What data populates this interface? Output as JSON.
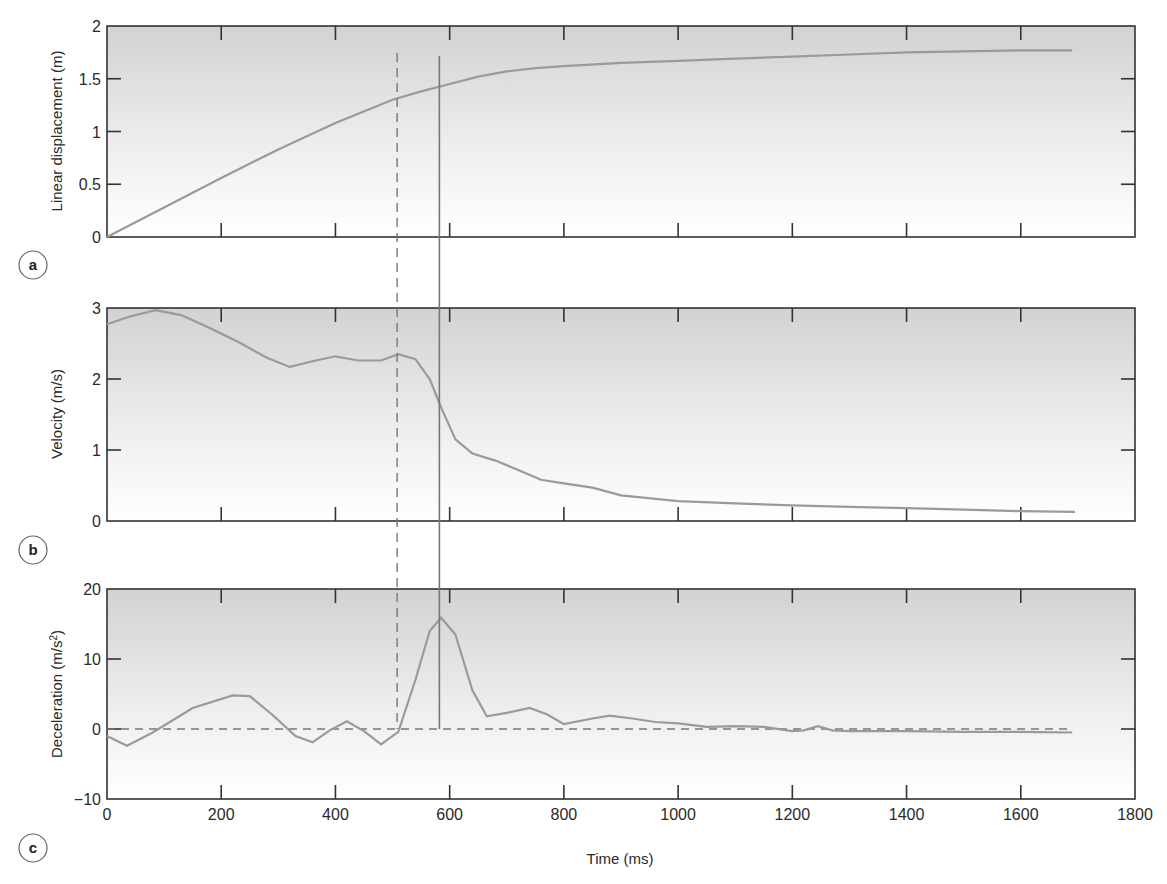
{
  "figure": {
    "x_axis_label": "Time (ms)",
    "x_ticks": [
      0,
      200,
      400,
      600,
      800,
      1000,
      1200,
      1400,
      1600,
      1800
    ],
    "x_tick_labels": [
      "0",
      "200",
      "400",
      "600",
      "800",
      "1000",
      "1200",
      "1400",
      "1600",
      "1800"
    ],
    "xlim": [
      0,
      1800
    ],
    "markers": {
      "dashed_vertical_ms": 508,
      "solid_vertical_ms": 582
    },
    "colors": {
      "curve": "#9a9a9a",
      "frame": "#333333",
      "marker_line": "#777777",
      "panel_bg_top": "#d4d4d4",
      "panel_bg_bottom": "#ffffff"
    }
  },
  "chart_data": [
    {
      "panel": "a",
      "type": "line",
      "title": "",
      "xlabel": "Time (ms)",
      "ylabel": "Linear displacement (m)",
      "ylim": [
        0,
        2
      ],
      "y_ticks": [
        0,
        0.5,
        1,
        1.5,
        2
      ],
      "y_tick_labels": [
        "0",
        "0.5",
        "1",
        "1.5",
        "2"
      ],
      "grid": false,
      "series": [
        {
          "name": "Linear displacement",
          "x": [
            0,
            100,
            200,
            300,
            400,
            500,
            550,
            600,
            650,
            700,
            750,
            800,
            900,
            1000,
            1100,
            1200,
            1300,
            1400,
            1500,
            1600,
            1690
          ],
          "y": [
            0,
            0.28,
            0.56,
            0.83,
            1.08,
            1.3,
            1.38,
            1.45,
            1.52,
            1.57,
            1.6,
            1.62,
            1.65,
            1.67,
            1.69,
            1.71,
            1.73,
            1.75,
            1.76,
            1.77,
            1.77
          ]
        }
      ]
    },
    {
      "panel": "b",
      "type": "line",
      "title": "",
      "xlabel": "Time (ms)",
      "ylabel": "Velocity (m/s)",
      "ylim": [
        0,
        3
      ],
      "y_ticks": [
        0,
        1,
        2,
        3
      ],
      "y_tick_labels": [
        "0",
        "1",
        "2",
        "3"
      ],
      "grid": false,
      "series": [
        {
          "name": "Velocity",
          "x": [
            0,
            40,
            85,
            130,
            180,
            230,
            280,
            320,
            360,
            400,
            440,
            480,
            510,
            540,
            565,
            585,
            610,
            640,
            680,
            720,
            760,
            800,
            850,
            900,
            1000,
            1100,
            1200,
            1300,
            1400,
            1500,
            1600,
            1695
          ],
          "y": [
            2.77,
            2.88,
            2.97,
            2.9,
            2.72,
            2.52,
            2.3,
            2.17,
            2.25,
            2.32,
            2.26,
            2.26,
            2.35,
            2.28,
            2.0,
            1.6,
            1.15,
            0.95,
            0.85,
            0.72,
            0.58,
            0.53,
            0.47,
            0.36,
            0.28,
            0.25,
            0.22,
            0.2,
            0.18,
            0.16,
            0.14,
            0.13
          ]
        }
      ]
    },
    {
      "panel": "c",
      "type": "line",
      "title": "",
      "xlabel": "Time (ms)",
      "ylabel": "Deceleration (m/s2)",
      "ylabel_superscript": "2",
      "ylim": [
        -10,
        20
      ],
      "y_ticks": [
        -10,
        0,
        10,
        20
      ],
      "y_tick_labels": [
        "−10",
        "0",
        "10",
        "20"
      ],
      "zero_reference": "dashed",
      "grid": false,
      "series": [
        {
          "name": "Deceleration",
          "x": [
            0,
            35,
            80,
            150,
            220,
            250,
            290,
            330,
            360,
            390,
            420,
            450,
            480,
            510,
            540,
            565,
            585,
            610,
            640,
            665,
            700,
            740,
            770,
            800,
            850,
            880,
            920,
            960,
            1000,
            1050,
            1100,
            1150,
            1200,
            1220,
            1245,
            1270,
            1300,
            1400,
            1500,
            1600,
            1690
          ],
          "y": [
            -1.0,
            -2.4,
            -0.5,
            3.0,
            4.8,
            4.7,
            2.0,
            -1.0,
            -1.9,
            -0.2,
            1.1,
            -0.3,
            -2.2,
            -0.4,
            7.0,
            14.0,
            15.9,
            13.5,
            5.5,
            1.8,
            2.3,
            3.0,
            2.1,
            0.7,
            1.5,
            1.9,
            1.5,
            1.0,
            0.8,
            0.3,
            0.4,
            0.3,
            -0.3,
            -0.2,
            0.4,
            -0.2,
            -0.3,
            -0.3,
            -0.4,
            -0.4,
            -0.5
          ]
        }
      ]
    }
  ],
  "panel_labels": [
    "a",
    "b",
    "c"
  ]
}
